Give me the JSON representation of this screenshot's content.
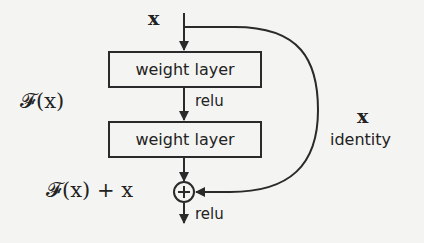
{
  "diagram": {
    "input_label": "x",
    "layers": [
      {
        "label": "weight layer"
      },
      {
        "label": "weight layer"
      }
    ],
    "activation_between": "relu",
    "activation_after": "relu",
    "residual_function_label": "𝓕(x)",
    "sum_label": "𝓕(x) + x",
    "shortcut": {
      "label_x": "x",
      "label_name": "identity"
    },
    "add_operator_symbol": "+",
    "colors": {
      "background": "#f4f4f2",
      "stroke": "#2a2a2a",
      "text": "#222222"
    }
  }
}
